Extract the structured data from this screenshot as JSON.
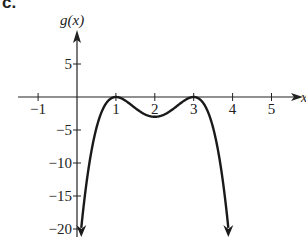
{
  "panel_label": "c.",
  "chart_data": {
    "type": "line",
    "title": "",
    "panel": "c.",
    "xlabel": "x",
    "ylabel": "g(x)",
    "xlim": [
      -1.5,
      5.8
    ],
    "ylim": [
      -21.5,
      9
    ],
    "x_ticks": [
      -1,
      1,
      2,
      3,
      4,
      5
    ],
    "x_tick_labels": [
      "−1",
      "1",
      "2",
      "3",
      "4",
      "5"
    ],
    "y_ticks": [
      5,
      -5,
      -10,
      -15,
      -20
    ],
    "y_tick_labels": [
      "5",
      "−5",
      "−10",
      "−15",
      "−20"
    ],
    "grid": false,
    "legend": null,
    "series": [
      {
        "name": "g(x)",
        "formula": "-3(x-1)^2(x-3)^2",
        "x": [
          0.11,
          0.3,
          0.5,
          0.75,
          1,
          1.25,
          1.5,
          1.75,
          2,
          2.25,
          2.5,
          2.75,
          3,
          3.25,
          3.5,
          3.7,
          3.89
        ],
        "y": [
          -20,
          -11.6,
          -4.7,
          -1.7,
          0,
          -1.0,
          -2.8,
          -3.0,
          -3,
          -2.5,
          -1.7,
          -0.7,
          0,
          -0.3,
          -1.2,
          -4.7,
          -20
        ],
        "local_maxima": [
          [
            1,
            0
          ],
          [
            3,
            0
          ]
        ],
        "local_minimum": [
          2,
          -3
        ],
        "end_behavior": "arrows pointing down at both ends"
      }
    ]
  },
  "axes": {
    "x_label": "x",
    "y_label": "g(x)"
  }
}
